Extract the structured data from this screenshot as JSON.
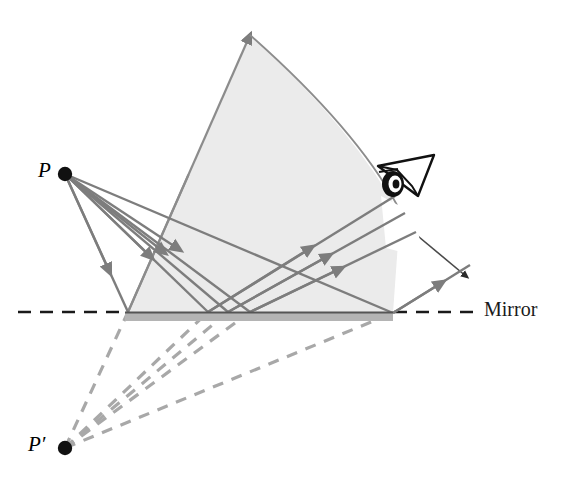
{
  "figure": {
    "background_color": "#ffffff"
  },
  "labels": {
    "object_point": "P",
    "image_point": "P′",
    "mirror": "Mirror"
  },
  "colors": {
    "ray_stroke": "#7d7d7d",
    "virtual_ray_stroke": "#a8a8a8",
    "cone_fill": "#ebebeb",
    "cone_stroke": "#8c8c8c",
    "mirror_fill": "#b4b4b4",
    "mirror_top": "#555555",
    "axis_dash": "#1a1a1a",
    "point_fill": "#111111",
    "eye_stroke": "#111111"
  },
  "geometry": {
    "object_point": {
      "x": 65,
      "y": 174,
      "r": 7
    },
    "image_point": {
      "x": 65,
      "y": 448,
      "r": 7
    },
    "mirror_line": {
      "x1": 0,
      "y1": 312,
      "x2": 584,
      "y2": 312
    },
    "mirror_bar": {
      "x": 125,
      "y": 312,
      "width": 268,
      "height": 9
    },
    "cone_apex": {
      "x": 250,
      "y": 35
    },
    "cone_left_base": {
      "x": 128,
      "y": 312
    },
    "cone_right_base": {
      "x": 393,
      "y": 313
    },
    "eye": {
      "x": 400,
      "y": 180
    },
    "reflection_points": [
      128,
      208,
      228,
      250,
      393
    ]
  },
  "elements": {
    "incident_rays": "Four solid gray rays travelling from object point P down to the mirror surface",
    "reflected_rays": "Solid gray rays travelling up and to the right from the mirror toward the eye",
    "virtual_rays": "Dashed gray lines extending back from the mirror to the virtual image point P-prime",
    "shaded_cone": "Light gray shaded fan showing the bundle of light reaching the eye",
    "arc": "Curved arrow spanning the top of the shaded fan",
    "eye_icon": "eye-icon",
    "mirror_surface": "Horizontal gray bar representing the plane mirror",
    "optical_axis": "Black dashed horizontal line through the mirror plane"
  }
}
